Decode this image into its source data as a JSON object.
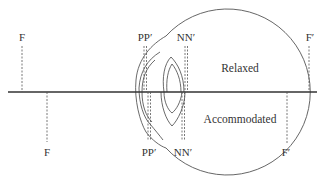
{
  "diagram": {
    "type": "schematic-eye-cardinal-points",
    "regions": {
      "upper_label": "Relaxed",
      "lower_label": "Accommodated"
    },
    "cardinal_points": {
      "relaxed": [
        {
          "id": "F",
          "label": "F",
          "x": 22
        },
        {
          "id": "PP",
          "label": "PP′",
          "x": 145
        },
        {
          "id": "NN",
          "label": "NN′",
          "x": 186
        },
        {
          "id": "F_prime",
          "label": "F′",
          "x": 309
        }
      ],
      "accommodated": [
        {
          "id": "F",
          "label": "F",
          "x": 47
        },
        {
          "id": "PP",
          "label": "PP′",
          "x": 149
        },
        {
          "id": "NN",
          "label": "NN′",
          "x": 183
        },
        {
          "id": "F_prime",
          "label": "F′",
          "x": 287
        }
      ]
    },
    "colors": {
      "line": "#333333",
      "dashed": "#555555",
      "text": "#333333",
      "background": "#ffffff"
    }
  }
}
